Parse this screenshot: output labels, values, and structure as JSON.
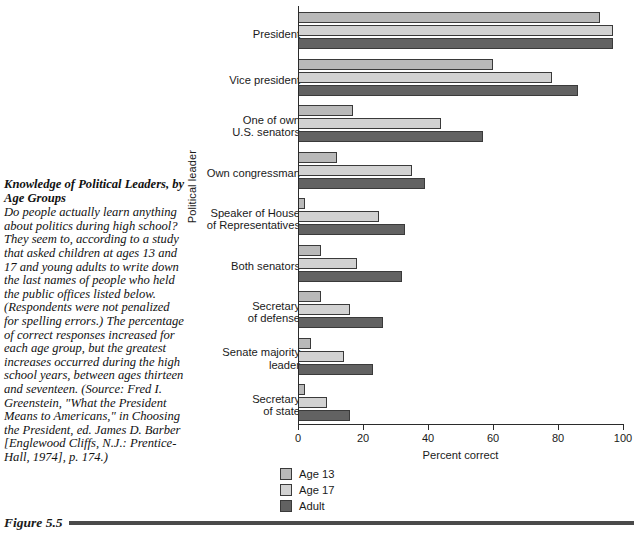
{
  "figure": {
    "number": "Figure 5.5",
    "caption_title": "Knowledge of Political Leaders, by Age Groups",
    "caption_body": "Do people actually learn anything about politics during high school? They seem to, according to a study that asked children at ages 13 and 17 and young adults to write down the last names of people who held the public offices listed below. (Respondents were not penalized for spelling errors.) The percentage of correct responses increased for each age group, but the greatest increases occurred during the high school years, between ages thirteen and seventeen. (Source: Fred I. Greenstein, \"What the President Means to Americans,\" in Choosing the President, ed. James D. Barber [Englewood Cliffs, N.J.: Prentice-Hall, 1974], p. 174.)"
  },
  "chart_data": {
    "type": "bar",
    "orientation": "horizontal",
    "title": "",
    "xlabel": "Percent correct",
    "ylabel": "Political leader",
    "xlim": [
      0,
      100
    ],
    "xticks": [
      0,
      20,
      40,
      60,
      80,
      100
    ],
    "xtick_labels": [
      "0",
      "20",
      "40",
      "60",
      "80",
      "100"
    ],
    "grid": false,
    "legend_position": "below-left",
    "categories": [
      "President",
      "Vice president",
      "One of own\nU.S. senators",
      "Own congressman",
      "Speaker of House\nof Representatives",
      "Both senators",
      "Secretary\nof defense",
      "Senate majority\nleader",
      "Secretary\nof state"
    ],
    "series": [
      {
        "name": "Age 13",
        "color": "#b9b9b9",
        "values": [
          93,
          60,
          17,
          12,
          2,
          7,
          7,
          4,
          2
        ]
      },
      {
        "name": "Age 17",
        "color": "#d2d2d2",
        "values": [
          97,
          78,
          44,
          35,
          25,
          18,
          16,
          14,
          9
        ]
      },
      {
        "name": "Adult",
        "color": "#626262",
        "values": [
          97,
          86,
          57,
          39,
          33,
          32,
          26,
          23,
          16
        ]
      }
    ]
  }
}
